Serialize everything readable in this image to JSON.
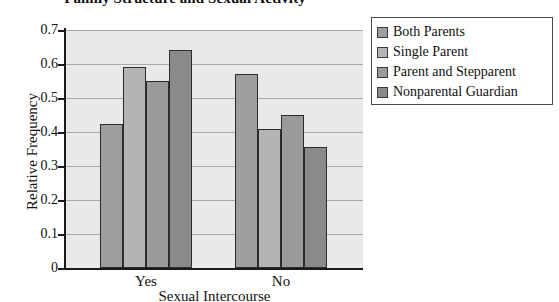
{
  "chart_data": {
    "type": "bar",
    "title": "Family Structure and Sexual Activity",
    "xlabel": "Sexual Intercourse",
    "ylabel": "Relative Frequency",
    "categories": [
      "Yes",
      "No"
    ],
    "series": [
      {
        "name": "Both Parents",
        "values": [
          0.425,
          0.57
        ],
        "color": "#9e9e9e"
      },
      {
        "name": "Single Parent",
        "values": [
          0.59,
          0.41
        ],
        "color": "#b4b4b4"
      },
      {
        "name": "Parent and Stepparent",
        "values": [
          0.55,
          0.45
        ],
        "color": "#9a9a9a"
      },
      {
        "name": "Nonparental Guardian",
        "values": [
          0.64,
          0.355
        ],
        "color": "#8a8a8a"
      }
    ],
    "ylim": [
      0,
      0.7
    ],
    "ytick_labels": [
      "0.7",
      "0.6",
      "0.5",
      "0.4",
      "0.3",
      "0.2",
      "0.1",
      "0"
    ],
    "ytick_values": [
      0.7,
      0.6,
      0.5,
      0.4,
      0.3,
      0.2,
      0.1,
      0
    ],
    "grid": true,
    "legend_position": "right-outside",
    "plot_background": "#e9e9e9",
    "gridline_color": "#a9a9a9",
    "axis_color": "#1a1a1a"
  }
}
